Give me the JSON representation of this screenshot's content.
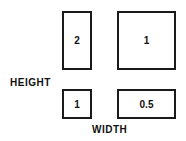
{
  "axes": {
    "vertical_label": "HEIGHT",
    "horizontal_label": "WIDTH"
  },
  "boxes": [
    {
      "id": "tall",
      "value": "2"
    },
    {
      "id": "large-square",
      "value": "1"
    },
    {
      "id": "small-square",
      "value": "1"
    },
    {
      "id": "wide",
      "value": "0.5"
    }
  ]
}
